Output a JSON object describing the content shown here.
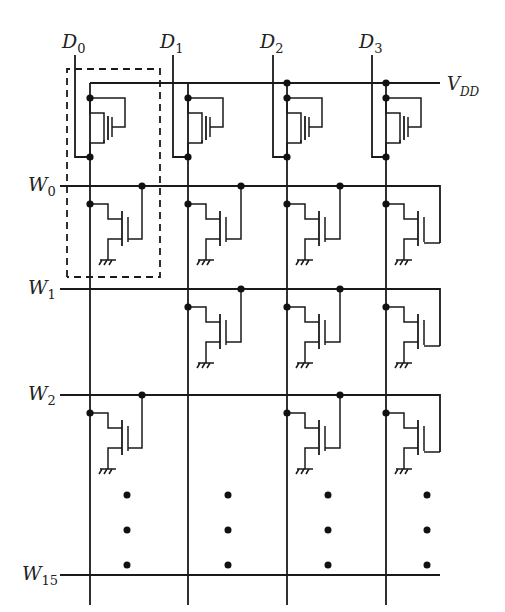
{
  "diagram": {
    "supply_label": {
      "main": "V",
      "sub": "DD"
    },
    "data_lines": [
      {
        "main": "D",
        "sub": "0",
        "x": 75,
        "rail_x": 90
      },
      {
        "main": "D",
        "sub": "1",
        "x": 173,
        "rail_x": 188
      },
      {
        "main": "D",
        "sub": "2",
        "x": 273,
        "rail_x": 287
      },
      {
        "main": "D",
        "sub": "3",
        "x": 372,
        "rail_x": 386
      }
    ],
    "word_lines": [
      {
        "main": "W",
        "sub": "0",
        "y": 186,
        "cells": [
          1,
          1,
          1,
          1
        ]
      },
      {
        "main": "W",
        "sub": "1",
        "y": 289,
        "cells": [
          0,
          1,
          1,
          1
        ]
      },
      {
        "main": "W",
        "sub": "2",
        "y": 395,
        "cells": [
          1,
          0,
          1,
          1
        ]
      },
      {
        "main": "W",
        "sub": "15",
        "y": 575,
        "cells": [
          0,
          0,
          0,
          0
        ]
      }
    ],
    "vdd_y": 83,
    "highlighted_cell": "dashed box around D0 load transistor and W0 cell",
    "ellipsis": "vertical dots indicating rows W3 to W14 omitted",
    "colors": {
      "ink": "#1a1a1a",
      "background": "#ffffff"
    }
  }
}
